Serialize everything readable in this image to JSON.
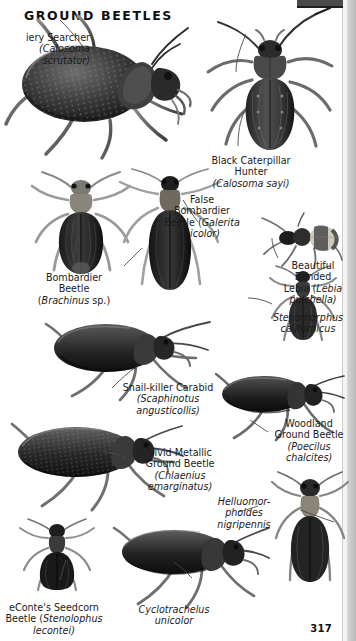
{
  "page": {
    "title": "GROUND BEETLES",
    "number": "317",
    "ink_color": "#1b1b1b",
    "background_color": "#ffffff",
    "edge_strip_color": "#cfcfcf"
  },
  "captions": [
    {
      "id": "fiery-searcher",
      "common": "iery Searcher",
      "scientific": "(Calosoma scrutator)",
      "lines": [
        "iery Searcher",
        "(Calosoma",
        "scrutator)"
      ],
      "align": "right",
      "clipped": true
    },
    {
      "id": "black-caterpillar-hunter",
      "common": "Black Caterpillar Hunter",
      "scientific": "(Calosoma sayi)",
      "lines": [
        "Black Caterpillar",
        "Hunter",
        "(Calosoma sayi)"
      ],
      "align": "center"
    },
    {
      "id": "false-bombardier-beetle",
      "common": "False Bombardier Beetle",
      "scientific": "(Galerita bicolor)",
      "lines": [
        "False",
        "Bombardier",
        "Beetle (Galerita",
        "bicolor)"
      ],
      "align": "center"
    },
    {
      "id": "bombardier-beetle",
      "common": "Bombardier Beetle",
      "scientific": "(Brachinus sp.)",
      "lines": [
        "Bombardier",
        "Beetle",
        "(Brachinus sp.)"
      ],
      "align": "center"
    },
    {
      "id": "beautiful-banded-lebia",
      "common": "Beautiful Banded Lebia",
      "scientific": "(Lebia pulchella)",
      "lines": [
        "Beautiful",
        "Banded",
        "Lebia (Lebia",
        "pulchella)"
      ],
      "align": "center"
    },
    {
      "id": "stenomorphus-californicus",
      "common": "",
      "scientific": "Stenomorphus californicus",
      "lines": [
        "Stenomorphus",
        "californicus"
      ],
      "align": "center",
      "italic_only": true
    },
    {
      "id": "snail-killer-carabid",
      "common": "Snail-killer Carabid",
      "scientific": "(Scaphinotus angusticollis)",
      "lines": [
        "Snail-killer Carabid",
        "(Scaphinotus",
        "angusticollis)"
      ],
      "align": "center"
    },
    {
      "id": "woodland-ground-beetle",
      "common": "Woodland Ground Beetle",
      "scientific": "(Poecilus chalcites)",
      "lines": [
        "Woodland",
        "Ground Beetle",
        "(Poecilus",
        "chalcites)"
      ],
      "align": "center"
    },
    {
      "id": "vivid-metallic-ground-beetle",
      "common": "Vivid Metallic Ground Beetle",
      "scientific": "(Chlaenius emarginatus)",
      "lines": [
        "Vivid Metallic",
        "Ground Beetle",
        "(Chlaenius",
        "emarginatus)"
      ],
      "align": "center"
    },
    {
      "id": "helluomorphoides-nigripennis",
      "common": "",
      "scientific": "Helluomorphoides nigripennis",
      "lines": [
        "Helluomor-",
        "phoides",
        "nigripennis"
      ],
      "align": "center",
      "italic_only": true
    },
    {
      "id": "leconte-seedcorn-beetle",
      "common": "eConte's Seedcorn Beetle",
      "scientific": "(Stenolophus lecontei)",
      "lines": [
        "eConte's Seedcorn",
        "Beetle (Stenolophus",
        "lecontei)"
      ],
      "align": "center",
      "clipped": true
    },
    {
      "id": "cyclotrachelus-unicolor",
      "common": "",
      "scientific": "Cyclotrachelus unicolor",
      "lines": [
        "Cyclotrachelus",
        "unicolor"
      ],
      "align": "center",
      "italic_only": true
    }
  ],
  "text": {
    "fiery_l1": "iery Searcher",
    "fiery_l2": "(Calosoma",
    "fiery_l3": "scrutator)",
    "bch_l1": "Black Caterpillar",
    "bch_l2": "Hunter",
    "bch_l3": "(Calosoma sayi)",
    "fbb_l1": "False",
    "fbb_l2": "Bombardier",
    "fbb_l3a": "Beetle (",
    "fbb_l3b": "Galerita",
    "fbb_l4": "bicolor)",
    "bb_l1": "Bombardier",
    "bb_l2": "Beetle",
    "bb_l3a": "(",
    "bb_l3b": "Brachinus",
    "bb_l3c": " sp.)",
    "lebia_l1": "Beautiful",
    "lebia_l2": "Banded",
    "lebia_l3a": "Lebia (",
    "lebia_l3b": "Lebia",
    "lebia_l4": "pulchella)",
    "steno_l1": "Stenomorphus",
    "steno_l2": "californicus",
    "snail_l1": "Snail-killer Carabid",
    "snail_l2": "(Scaphinotus",
    "snail_l3": "angusticollis)",
    "wood_l1": "Woodland",
    "wood_l2": "Ground Beetle",
    "wood_l3": "(Poecilus",
    "wood_l4": "chalcites)",
    "vivid_l1": "Vivid Metallic",
    "vivid_l2": "Ground Beetle",
    "vivid_l3": "(Chlaenius",
    "vivid_l4": "emarginatus)",
    "hell_l1": "Helluomor-",
    "hell_l2": "phoides",
    "hell_l3": "nigripennis",
    "lec_l1": "eConte's Seedcorn",
    "lec_l2a": "Beetle (",
    "lec_l2b": "Stenolophus",
    "lec_l3": "lecontei)",
    "cyclo_l1": "Cyclotrachelus",
    "cyclo_l2": "unicolor"
  },
  "specimens": [
    {
      "name": "fiery-searcher",
      "label": "Calosoma scrutator",
      "orientation": "lateral-left"
    },
    {
      "name": "black-caterpillar-hunter",
      "label": "Calosoma sayi",
      "orientation": "dorsal"
    },
    {
      "name": "bombardier-beetle",
      "label": "Brachinus sp.",
      "orientation": "dorsal"
    },
    {
      "name": "false-bombardier-beetle",
      "label": "Galerita bicolor",
      "orientation": "dorsal"
    },
    {
      "name": "beautiful-banded-lebia",
      "label": "Lebia pulchella",
      "orientation": "dorsal-oblique"
    },
    {
      "name": "stenomorphus-californicus",
      "label": "Stenomorphus californicus",
      "orientation": "dorsal"
    },
    {
      "name": "snail-killer-carabid",
      "label": "Scaphinotus angusticollis",
      "orientation": "lateral-right"
    },
    {
      "name": "woodland-ground-beetle",
      "label": "Poecilus chalcites",
      "orientation": "lateral-right"
    },
    {
      "name": "vivid-metallic-ground-beetle",
      "label": "Chlaenius emarginatus",
      "orientation": "lateral-right"
    },
    {
      "name": "helluomorphoides-nigripennis",
      "label": "Helluomorphoides nigripennis",
      "orientation": "dorsal"
    },
    {
      "name": "leconte-seedcorn-beetle",
      "label": "Stenolophus lecontei",
      "orientation": "dorsal"
    },
    {
      "name": "cyclotrachelus-unicolor",
      "label": "Cyclotrachelus unicolor",
      "orientation": "lateral-right"
    }
  ]
}
